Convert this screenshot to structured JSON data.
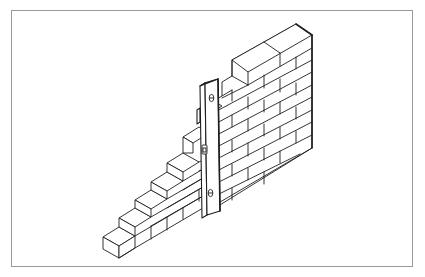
{
  "figure": {
    "frame_color": "#9a9a9a",
    "line_color": "#1e1e1e",
    "background": "#ffffff"
  },
  "wall": {
    "type": "stepped (racked-back) brick wall",
    "courses": 10,
    "bond": "stretcher bond"
  },
  "tool": {
    "name": "spirit level",
    "orientation": "vertical (plumb check)",
    "vials": [
      "top-vial",
      "middle-vial",
      "bottom-vial"
    ]
  }
}
